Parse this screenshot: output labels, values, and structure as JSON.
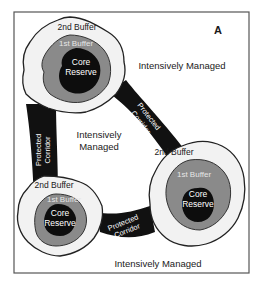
{
  "panel_label": "A",
  "colors": {
    "background": "#ffffff",
    "frame": "#555555",
    "second_buffer": "#f2f2f2",
    "first_buffer": "#8a8a8a",
    "core_reserve": "#0d0d0d",
    "corridor": "#111111",
    "outline": "#222222"
  },
  "regions": {
    "matrix_label_top": "Intensively Managed",
    "matrix_label_center": [
      "Intensively",
      "Managed"
    ],
    "matrix_label_bottom": "Intensively Managed"
  },
  "reserves": [
    {
      "id": "top-left",
      "second_buffer_label": "2nd Buffer",
      "first_buffer_label": "1st Buffer",
      "core_label": [
        "Core",
        "Reserve"
      ]
    },
    {
      "id": "bottom-left",
      "second_buffer_label": "2nd Buffer",
      "first_buffer_label": "1st Buffer",
      "core_label": [
        "Core",
        "Reserve"
      ]
    },
    {
      "id": "bottom-right",
      "second_buffer_label": "2nd Buffer",
      "first_buffer_label": "1st Buffer",
      "core_label": [
        "Core",
        "Reserve"
      ]
    }
  ],
  "corridors": [
    {
      "id": "left",
      "label": [
        "Protected",
        "Corridor"
      ]
    },
    {
      "id": "diagonal",
      "label": [
        "Protected",
        "Corridor"
      ]
    },
    {
      "id": "bottom",
      "label": [
        "Protected",
        "Corridor"
      ]
    }
  ]
}
